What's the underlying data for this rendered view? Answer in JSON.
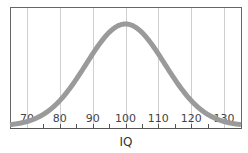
{
  "chart_data": {
    "type": "line",
    "title": "",
    "xlabel": "IQ",
    "ylabel": "",
    "x_ticks": [
      70,
      80,
      90,
      100,
      110,
      120,
      130
    ],
    "xlim": [
      65,
      135
    ],
    "grid": true,
    "legend": null,
    "series": [
      {
        "name": "Normal distribution of IQ",
        "distribution": "normal",
        "mean": 100,
        "sd": 15,
        "x": [
          65,
          70,
          75,
          80,
          85,
          90,
          95,
          100,
          105,
          110,
          115,
          120,
          125,
          130,
          135
        ],
        "y_relative": [
          0.07,
          0.14,
          0.26,
          0.41,
          0.61,
          0.8,
          0.95,
          1.0,
          0.95,
          0.8,
          0.61,
          0.41,
          0.26,
          0.14,
          0.07
        ]
      }
    ],
    "colors": {
      "curve": "#9a9a9a",
      "grid": "#cfcfcf",
      "frame": "#555555"
    }
  }
}
